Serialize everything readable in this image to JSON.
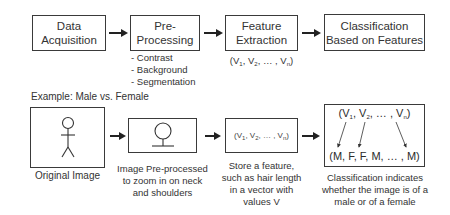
{
  "pipeline": {
    "steps": [
      {
        "line1": "Data",
        "line2": "Acquisition"
      },
      {
        "line1": "Pre-",
        "line2": "Processing"
      },
      {
        "line1": "Feature",
        "line2": "Extraction"
      },
      {
        "line1": "Classification",
        "line2": "Based on Features"
      }
    ],
    "preprocessing_items": [
      "- Contrast",
      "- Background",
      "- Segmentation"
    ],
    "feature_vector": {
      "open": "(V",
      "s1": "1",
      "sep1": ", V",
      "s2": "2",
      "mid": ", … , V",
      "sn": "n",
      "close": ")"
    }
  },
  "example": {
    "title": "Example: Male vs. Female",
    "original_caption": "Original Image",
    "preprocessed_caption": [
      "Image Pre-processed",
      "to zoom in on neck",
      "and shoulders"
    ],
    "feature_caption": [
      "Store a feature,",
      "such as hair length",
      "in a vector with",
      "values V"
    ],
    "classification_caption": [
      "Classification indicates",
      "whether the image is of a",
      "male or of a female"
    ],
    "classification_output": "(M, F, F, M, … , M)"
  }
}
